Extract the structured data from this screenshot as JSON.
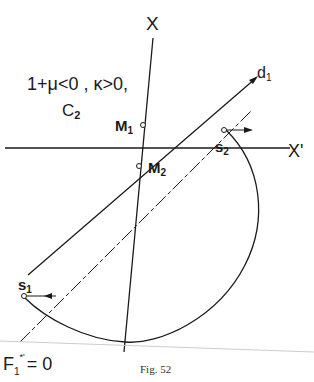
{
  "figure": {
    "caption": "Fig. 52",
    "condition_line1": "1+μ<0 , κ>0,",
    "condition_line2": "C",
    "condition_line2_sub": "2"
  },
  "labels": {
    "axis_x": "X",
    "axis_x_prime": "X'",
    "line_d": "d",
    "line_d_sub": "1",
    "point_m1": "M",
    "point_m1_sub": "1",
    "point_m2": "M",
    "point_m2_sub": "2",
    "point_s1": "s",
    "point_s1_sub": "1",
    "point_s2": "s",
    "point_s2_sub": "2",
    "line_f": "F",
    "line_f_sub": "1",
    "line_f_sup": "*'",
    "line_f_eq": "= 0"
  },
  "colors": {
    "ink": "#1a1a1a",
    "background": "#ffffff"
  }
}
